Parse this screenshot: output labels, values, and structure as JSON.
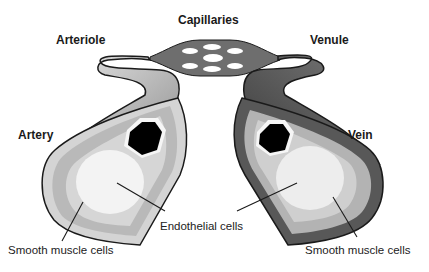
{
  "diagram": {
    "labels": {
      "capillaries": "Capillaries",
      "arteriole": "Arteriole",
      "venule": "Venule",
      "artery": "Artery",
      "vein": "Vein",
      "endothelial_cells": "Endothelial cells",
      "smooth_muscle_left": "Smooth muscle cells",
      "smooth_muscle_right": "Smooth muscle cells"
    },
    "colors": {
      "outline": "#1a1a1a",
      "artery_outer": "#cfcfcf",
      "artery_muscle": "#b8b8b8",
      "artery_inner": "#d9d9d9",
      "lumen_wall": "#f4f4f4",
      "lumen": "#000000",
      "vein_outer": "#555555",
      "vein_muscle": "#b3b3b3",
      "vein_inner": "#e2e2e2",
      "capillary_net": "#6e6e6e"
    }
  }
}
